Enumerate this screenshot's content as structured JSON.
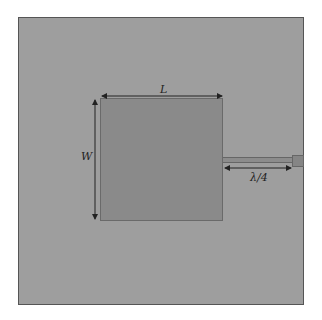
{
  "diagram": {
    "title": "",
    "type": "microstrip patch antenna (top view)",
    "colors": {
      "background": "#ffffff",
      "substrate": "#9e9e9e",
      "patch": "#8a8a8a",
      "feedline": "#8c8c8c",
      "connector": "#858585",
      "dimension_lines": "#222222"
    },
    "components": [
      {
        "id": "substrate",
        "label": "substrate / ground plane"
      },
      {
        "id": "patch",
        "label": "radiating patch"
      },
      {
        "id": "feedline",
        "label": "quarter-wave feed line"
      },
      {
        "id": "connector",
        "label": "feed port"
      }
    ],
    "dimensions": {
      "length_label": "L",
      "width_label": "W",
      "feed_label": "λ/4"
    }
  }
}
